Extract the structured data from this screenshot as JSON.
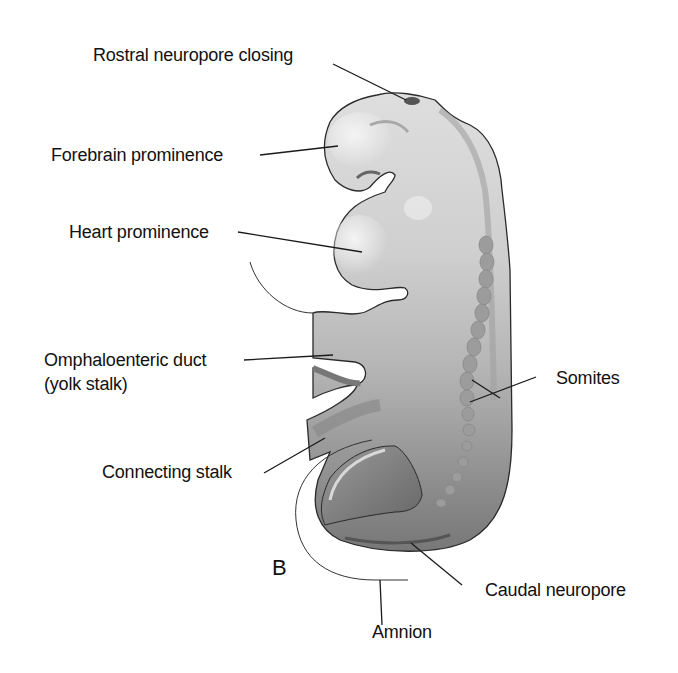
{
  "figure": {
    "panel_letter": "B",
    "labels": {
      "rostral_neuropore": "Rostral neuropore closing",
      "forebrain": "Forebrain prominence",
      "heart": "Heart prominence",
      "omphaloenteric_1": "Omphaloenteric duct",
      "omphaloenteric_2": "(yolk stalk)",
      "somites": "Somites",
      "connecting_stalk": "Connecting stalk",
      "caudal_neuropore": "Caudal neuropore",
      "amnion": "Amnion"
    },
    "colors": {
      "background": "#ffffff",
      "body_light": "#d9d9d9",
      "body_mid": "#b3b3b3",
      "body_dark": "#7a7a7a",
      "outline": "#2a2a2a",
      "text": "#111111"
    }
  }
}
